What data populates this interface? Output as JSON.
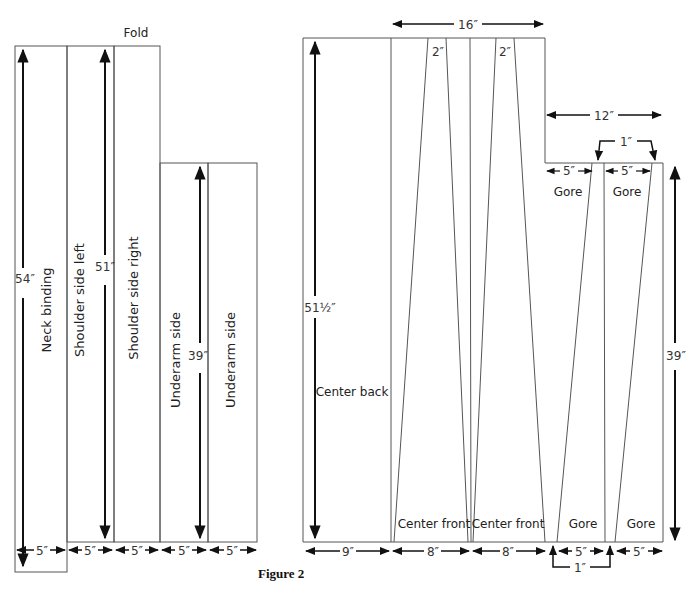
{
  "figure": {
    "caption": "Figure 2",
    "fold_label": "Fold"
  },
  "left_panel": {
    "pieces": [
      {
        "label": "Neck binding"
      },
      {
        "label": "Shoulder side left"
      },
      {
        "label": "Shoulder side right"
      },
      {
        "label": "Underarm side"
      },
      {
        "label": "Underarm side"
      }
    ],
    "heights": {
      "neck": "54″",
      "shoulder": "51″",
      "underarm": "39″"
    },
    "widths": [
      "5″",
      "5″",
      "5″",
      "5″",
      "5″"
    ]
  },
  "right_panel": {
    "labels": {
      "center_back": "Center back",
      "center_front_1": "Center front",
      "center_front_2": "Center front",
      "gore_top_1": "Gore",
      "gore_top_2": "Gore",
      "gore_bottom_1": "Gore",
      "gore_bottom_2": "Gore"
    },
    "dims": {
      "top_width": "16″",
      "dart_1": "2″",
      "dart_2": "2″",
      "step_width": "12″",
      "gore_gap_top": "1″",
      "gore_top_w1": "5″",
      "gore_top_w2": "5″",
      "height_left": "51½″",
      "height_right": "39″",
      "bottom": [
        "9″",
        "8″",
        "8″",
        "5″",
        "5″"
      ],
      "gore_gap_bottom": "1″"
    }
  }
}
